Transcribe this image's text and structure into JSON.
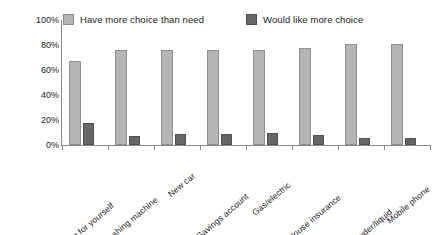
{
  "chart_data": {
    "type": "bar",
    "title": "",
    "xlabel": "",
    "ylabel": "",
    "ylim": [
      0,
      100
    ],
    "yticks": [
      "0%",
      "20%",
      "40%",
      "60%",
      "80%",
      "100%"
    ],
    "ytick_values": [
      0,
      20,
      40,
      60,
      80,
      100
    ],
    "grid": false,
    "legend_position": "top",
    "categories": [
      "Clothing for yourself",
      "Washing machine",
      "New car",
      "Savings account",
      "Gas/electric",
      "House insurance",
      "Washing powder/liquid",
      "Mobile phone"
    ],
    "series": [
      {
        "name": "Have more choice than need",
        "color": "#b5b5b5",
        "values": [
          67,
          76,
          76,
          76,
          76,
          78,
          81,
          81
        ]
      },
      {
        "name": "Would like more choice",
        "color": "#666666",
        "values": [
          18,
          7,
          9,
          9,
          10,
          8,
          6,
          6
        ]
      }
    ]
  },
  "colors": {
    "series_light": "#b5b5b5",
    "series_dark": "#666666",
    "axis": "#8a8a8a",
    "text": "#1a1a1a",
    "background": "#ffffff"
  }
}
